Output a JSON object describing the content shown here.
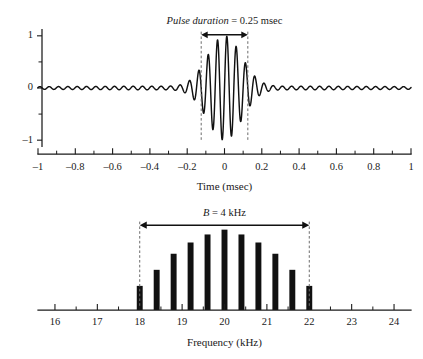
{
  "figure": {
    "background_color": "#ffffff",
    "ink_color": "#111111",
    "guide_color": "#6b6b6b"
  },
  "chart_data": [
    {
      "type": "line",
      "id": "pulse-waveform",
      "title": "",
      "xlabel": "Time (msec)",
      "ylabel": "",
      "xlim": [
        -1,
        1
      ],
      "ylim": [
        -1.15,
        1.15
      ],
      "grid": false,
      "legend": "none",
      "xticks": [
        -1,
        -0.8,
        -0.6,
        -0.4,
        -0.2,
        0,
        0.2,
        0.4,
        0.6,
        0.8,
        1
      ],
      "xtick_labels": [
        "–1",
        "–0.8",
        "–0.6",
        "–0.4",
        "–0.2",
        "0",
        "0.2",
        "0.4",
        "0.6",
        "0.8",
        "1"
      ],
      "xminor_step": 0.1,
      "yticks": [
        -1,
        0,
        1
      ],
      "ytick_labels": [
        "–1",
        "0",
        "1"
      ],
      "yminor": [
        -0.5,
        0.5
      ],
      "waveform": {
        "description": "Gaussian-windowed sinusoidal tone burst with low-amplitude ripple tails",
        "carrier_frequency_khz": 20,
        "envelope": "gaussian",
        "envelope_sigma_msec": 0.092,
        "ripple_amplitude": 0.045,
        "ripple_frequency_khz": 20,
        "peak_amplitude": 1.0,
        "samples_per_unit": 1400
      },
      "annotations": [
        {
          "id": "pulse-duration",
          "label_italic": "Pulse duration",
          "label_rest": " = 0.25 msec",
          "x_start": -0.125,
          "x_end": 0.125,
          "marker": "double-arrow",
          "guide_lines": "dashed vertical at ±0.125"
        }
      ]
    },
    {
      "type": "bar",
      "id": "frequency-spectrum",
      "title": "",
      "xlabel": "Frequency (kHz)",
      "ylabel": "",
      "xlim": [
        15.6,
        24.4
      ],
      "ylim": [
        0,
        1.12
      ],
      "grid": false,
      "legend": "none",
      "xticks": [
        16,
        17,
        18,
        19,
        20,
        21,
        22,
        23,
        24
      ],
      "xtick_labels": [
        "16",
        "17",
        "18",
        "19",
        "20",
        "21",
        "22",
        "23",
        "24"
      ],
      "xminor_step": 0.5,
      "categories": [
        18,
        18.4,
        18.8,
        19.2,
        19.6,
        20,
        20.4,
        20.8,
        21.2,
        21.6,
        22
      ],
      "values": [
        0.3,
        0.5,
        0.7,
        0.84,
        0.94,
        1.0,
        0.94,
        0.84,
        0.7,
        0.5,
        0.3
      ],
      "bar_width_khz": 0.14,
      "annotations": [
        {
          "id": "bandwidth",
          "label_italic": "B",
          "label_rest": " = 4 kHz",
          "x_start": 18,
          "x_end": 22,
          "marker": "double-arrow",
          "guide_lines": "dashed vertical at 18 and 22"
        }
      ]
    }
  ]
}
